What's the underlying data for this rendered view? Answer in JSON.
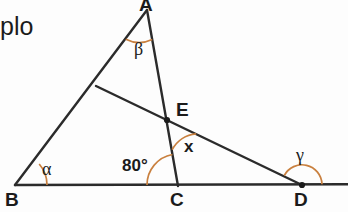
{
  "figure": {
    "corner_text": "plo",
    "stroke_color": "#2b2b2b",
    "arc_color": "#c9803f",
    "background_color": "#fdfdfd",
    "vertices": [
      {
        "id": "A",
        "label": "A",
        "x": 147,
        "y": 10
      },
      {
        "id": "B",
        "label": "B",
        "x": 15,
        "y": 185
      },
      {
        "id": "C",
        "label": "C",
        "x": 178,
        "y": 185
      },
      {
        "id": "D",
        "label": "D",
        "x": 302,
        "y": 185
      },
      {
        "id": "E",
        "label": "E",
        "x": 167,
        "y": 120
      },
      {
        "id": "F",
        "label": "",
        "x": 96,
        "y": 86
      }
    ],
    "marked_points": [
      "E",
      "D"
    ],
    "segments": [
      {
        "name": "baseline-BD-extended",
        "from": "B",
        "to": "right-edge"
      },
      {
        "name": "side-BA",
        "from": "B",
        "to": "A"
      },
      {
        "name": "cevian-AC",
        "from": "A",
        "to": "C"
      },
      {
        "name": "transversal-FD",
        "from": "F",
        "to": "D"
      }
    ],
    "angles": [
      {
        "name": "angle-alpha",
        "label": "α",
        "at": "B",
        "value": null
      },
      {
        "name": "angle-beta",
        "label": "β",
        "at": "A",
        "value": null
      },
      {
        "name": "angle-eighty",
        "label": "80°",
        "at": "C",
        "value": "80"
      },
      {
        "name": "angle-x",
        "label": "x",
        "at": "E",
        "value": null
      },
      {
        "name": "angle-gamma",
        "label": "γ",
        "at": "D",
        "value": null
      }
    ]
  }
}
